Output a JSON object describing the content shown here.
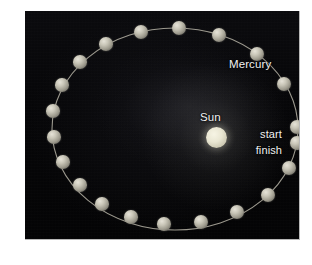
{
  "figure": {
    "background_color": "#ffffff",
    "panel_color": "#050505"
  },
  "labels": {
    "mercury": "Mercury",
    "sun": "Sun",
    "start": "start",
    "finish": "finish"
  },
  "colors": {
    "space": "#050505",
    "sun": "#ece9d6",
    "planet": "#c9c6b8",
    "orbit_path": "#b6b3a6",
    "text": "#f2f2f2"
  },
  "chart_data": {
    "type": "scatter",
    "xlabel": "",
    "ylabel": "",
    "orbit": {
      "shape": "ellipse",
      "center_x": 150,
      "center_y": 118,
      "radius_x": 123,
      "radius_y": 101,
      "stroke": "#b6b3a6",
      "stroke_width": 1.1
    },
    "sun": {
      "label": "Sun",
      "x": 191,
      "y": 126,
      "radius": 10.5,
      "color": "#ece9d6"
    },
    "series": [
      {
        "name": "Mercury positions",
        "marker": "sphere",
        "marker_color": "#c9c6b8",
        "points": [
          {
            "label": "start",
            "x": 272,
            "y": 116,
            "r": 7.2
          },
          {
            "label": "finish",
            "x": 272,
            "y": 132,
            "r": 7.2
          },
          {
            "label": "",
            "x": 264,
            "y": 157,
            "r": 7.0
          },
          {
            "label": "",
            "x": 243,
            "y": 184,
            "r": 7.0
          },
          {
            "label": "",
            "x": 212,
            "y": 201,
            "r": 7.0
          },
          {
            "label": "",
            "x": 176,
            "y": 211,
            "r": 7.0
          },
          {
            "label": "",
            "x": 139,
            "y": 213,
            "r": 6.8
          },
          {
            "label": "",
            "x": 106,
            "y": 206,
            "r": 6.8
          },
          {
            "label": "",
            "x": 77,
            "y": 193,
            "r": 6.8
          },
          {
            "label": "",
            "x": 55,
            "y": 174,
            "r": 6.8
          },
          {
            "label": "",
            "x": 38,
            "y": 151,
            "r": 6.8
          },
          {
            "label": "",
            "x": 29,
            "y": 126,
            "r": 6.8
          },
          {
            "label": "",
            "x": 28,
            "y": 100,
            "r": 6.8
          },
          {
            "label": "",
            "x": 37,
            "y": 74,
            "r": 6.8
          },
          {
            "label": "",
            "x": 55,
            "y": 51,
            "r": 6.8
          },
          {
            "label": "",
            "x": 81,
            "y": 33,
            "r": 6.8
          },
          {
            "label": "",
            "x": 116,
            "y": 21,
            "r": 7.0
          },
          {
            "label": "",
            "x": 154,
            "y": 17,
            "r": 7.2
          },
          {
            "label": "",
            "x": 194,
            "y": 24,
            "r": 7.2
          },
          {
            "label": "",
            "x": 232,
            "y": 43,
            "r": 7.2
          },
          {
            "label": "",
            "x": 259,
            "y": 73,
            "r": 7.2
          }
        ]
      }
    ],
    "annotations": [
      {
        "text": "Mercury",
        "x": 204,
        "y": 47,
        "color": "#f2f2f2",
        "anchor": "start"
      },
      {
        "text": "Sun",
        "x": 175,
        "y": 100,
        "color": "#f2f2f2",
        "anchor": "start"
      },
      {
        "text": "start",
        "x": 258,
        "y": 117,
        "color": "#f2f2f2",
        "anchor": "end"
      },
      {
        "text": "finish",
        "x": 258,
        "y": 133,
        "color": "#f2f2f2",
        "anchor": "end"
      }
    ]
  }
}
